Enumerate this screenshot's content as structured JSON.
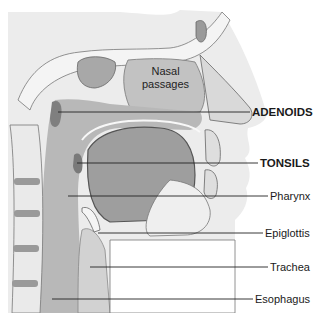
{
  "figure": {
    "inner_label": "Nasal passages",
    "inner_label_lines": [
      "Nasal",
      "passages"
    ],
    "labels": [
      {
        "text": "ADENOIDS",
        "bold": true,
        "y": 114
      },
      {
        "text": "TONSILS",
        "bold": true,
        "y": 163
      },
      {
        "text": "Pharynx",
        "bold": false,
        "y": 196
      },
      {
        "text": "Epiglottis",
        "bold": false,
        "y": 234
      },
      {
        "text": "Trachea",
        "bold": false,
        "y": 268
      },
      {
        "text": "Esophagus",
        "bold": false,
        "y": 300
      }
    ],
    "colors": {
      "background": "#ffffff",
      "skin": "#e4e4e4",
      "tissue": "#c9c9c9",
      "dark_tissue": "#8f8f8f",
      "airway": "#b5b5b5",
      "bone": "#efefef",
      "line": "#222222"
    }
  }
}
